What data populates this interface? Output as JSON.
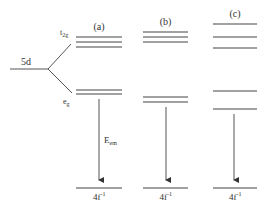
{
  "diagram": {
    "type": "energy-level-diagram",
    "line_color": "#444444",
    "free_ion": {
      "label": "5d",
      "split_labels": {
        "upper": "t",
        "upper_sub": "2g",
        "lower": "e",
        "lower_sub": "g"
      }
    },
    "panels": [
      {
        "id": "a",
        "label": "(a)",
        "t2g_levels_y": [
          37,
          42,
          47
        ],
        "eg_levels_y": [
          90,
          94
        ],
        "ground_y": 188,
        "x1": 76,
        "x2": 122,
        "arrow_x": 99,
        "arrow_label": "E",
        "arrow_label_sub": "em",
        "ground_label": "4f",
        "ground_label_sup": "-1"
      },
      {
        "id": "b",
        "label": "(b)",
        "t2g_levels_y": [
          32,
          37,
          42
        ],
        "eg_levels_y": [
          97,
          102
        ],
        "ground_y": 188,
        "x1": 143,
        "x2": 188,
        "arrow_x": 166,
        "ground_label": "4f",
        "ground_label_sup": "-1"
      },
      {
        "id": "c",
        "label": "(c)",
        "t2g_levels_y": [
          24,
          37,
          48
        ],
        "eg_levels_y": [
          91,
          109
        ],
        "ground_y": 188,
        "x1": 213,
        "x2": 257,
        "arrow_x": 234,
        "ground_label": "4f",
        "ground_label_sup": "-1"
      }
    ]
  }
}
